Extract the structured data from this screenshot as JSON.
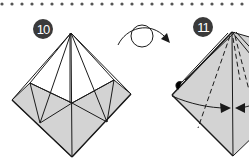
{
  "diagram": {
    "type": "origami-instructions",
    "separator": {
      "style": "dotted",
      "color": "#555555"
    },
    "steps": [
      {
        "number": "10",
        "badge_color": "#3a3a3a"
      },
      {
        "number": "11",
        "badge_color": "#3a3a3a"
      }
    ],
    "transition_symbol": "turn-over",
    "colors": {
      "paper": "#d3d3d3",
      "line": "#1a1a1a",
      "background": "#ffffff"
    }
  }
}
